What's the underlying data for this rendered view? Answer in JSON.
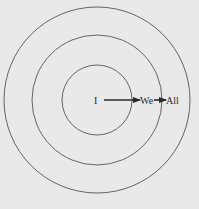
{
  "diagram": {
    "background": "#e9e9e9",
    "stroke_color": "#555555",
    "center": {
      "x": 97,
      "y": 100
    },
    "circles": [
      {
        "name": "outer",
        "r": 93
      },
      {
        "name": "middle",
        "r": 65
      },
      {
        "name": "inner",
        "r": 35
      }
    ],
    "labels": [
      {
        "id": "i",
        "text": "I"
      },
      {
        "id": "we",
        "text": "We"
      },
      {
        "id": "all",
        "text": "All"
      }
    ],
    "arrows": [
      {
        "from": "I",
        "to": "We"
      },
      {
        "from": "We",
        "to": "All"
      }
    ]
  }
}
